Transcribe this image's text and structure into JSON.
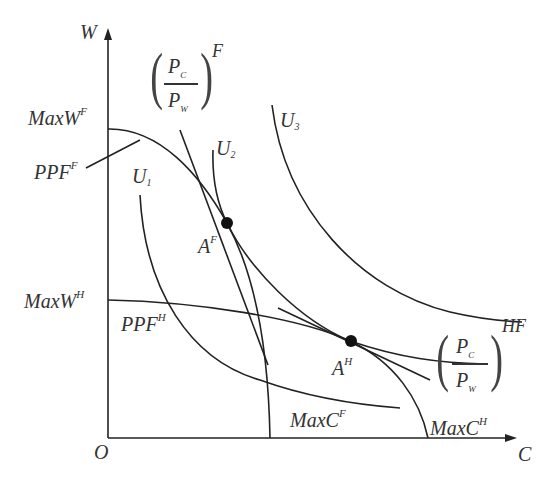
{
  "diagram": {
    "axes": {
      "y_label": "W",
      "x_label": "C",
      "origin_label": "O"
    },
    "labels": {
      "max_w_f": {
        "base": "MaxW",
        "sup": "F"
      },
      "ppf_f": {
        "base": "PPF",
        "sup": "F"
      },
      "max_w_h": {
        "base": "MaxW",
        "sup": "H"
      },
      "ppf_h": {
        "base": "PPF",
        "sup": "H"
      },
      "max_c_f": {
        "base": "MaxC",
        "sup": "F"
      },
      "max_c_h": {
        "base": "MaxC",
        "sup": "H"
      },
      "u1": {
        "base": "U",
        "sub": "1"
      },
      "u2": {
        "base": "U",
        "sub": "2"
      },
      "u3": {
        "base": "U",
        "sub": "3"
      },
      "a_f": {
        "base": "A",
        "sup": "F"
      },
      "a_h": {
        "base": "A",
        "sup": "H"
      }
    },
    "price_ratio_f": {
      "num": "P",
      "num_sub": "C",
      "den": "P",
      "den_sub": "W",
      "sup": "F"
    },
    "price_ratio_hf": {
      "num": "P",
      "num_sub": "C",
      "den": "P",
      "den_sub": "W",
      "sup": "HF"
    },
    "colors": {
      "line": "#222222",
      "text": "#333333",
      "background": "#ffffff"
    }
  }
}
